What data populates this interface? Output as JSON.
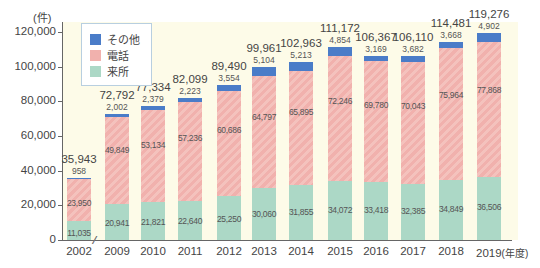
{
  "chart_data": {
    "type": "bar",
    "stacked": true,
    "title": "",
    "xlabel": "(年度)",
    "ylabel": "(件)",
    "ylim": [
      0,
      120000
    ],
    "yticks": [
      0,
      20000,
      40000,
      60000,
      80000,
      100000,
      120000
    ],
    "ytick_labels": [
      "0",
      "20,000",
      "40,000",
      "60,000",
      "80,000",
      "100,000",
      "120,000"
    ],
    "categories": [
      "2002",
      "2009",
      "2010",
      "2011",
      "2012",
      "2013",
      "2014",
      "2015",
      "2016",
      "2017",
      "2018",
      "2019"
    ],
    "axis_break_after": "2002",
    "legend_position": "upper-left",
    "grid": false,
    "series": [
      {
        "name": "来所",
        "color": "#acd8c6",
        "values": [
          11035,
          20941,
          21821,
          22640,
          25250,
          30060,
          31855,
          34072,
          33418,
          32385,
          34849,
          36506
        ]
      },
      {
        "name": "電話",
        "color": "#f1b1ad",
        "values": [
          23950,
          49849,
          53134,
          57236,
          60686,
          64797,
          65895,
          72246,
          69780,
          70043,
          75964,
          77868
        ]
      },
      {
        "name": "その他",
        "color": "#4a7cc8",
        "values": [
          958,
          2002,
          2379,
          2223,
          3554,
          5104,
          5213,
          4854,
          3169,
          3682,
          3668,
          4902
        ]
      }
    ],
    "totals": [
      35943,
      72792,
      77334,
      82099,
      89490,
      99961,
      102963,
      111172,
      106367,
      106110,
      114481,
      119276
    ],
    "value_labels": {
      "visit": [
        "11,035",
        "20,941",
        "21,821",
        "22,640",
        "25,250",
        "30,060",
        "31,855",
        "34,072",
        "33,418",
        "32,385",
        "34,849",
        "36,506"
      ],
      "phone": [
        "23,950",
        "49,849",
        "53,134",
        "57,236",
        "60,686",
        "64,797",
        "65,895",
        "72,246",
        "69,780",
        "70,043",
        "75,964",
        "77,868"
      ],
      "other": [
        "958",
        "2,002",
        "2,379",
        "2,223",
        "3,554",
        "5,104",
        "5,213",
        "4,854",
        "3,169",
        "3,682",
        "3,668",
        "4,902"
      ],
      "total": [
        "35,943",
        "72,792",
        "77,334",
        "82,099",
        "89,490",
        "99,961",
        "102,963",
        "111,172",
        "106,367",
        "106,110",
        "114,481",
        "119,276"
      ]
    }
  },
  "legend": {
    "items": [
      {
        "label": "その他",
        "color": "#4a7cc8"
      },
      {
        "label": "電話",
        "color": "#f1b1ad"
      },
      {
        "label": "来所",
        "color": "#acd8c6"
      }
    ]
  },
  "axis": {
    "y_unit": "(件)",
    "x_unit": "(年度)",
    "break_mark": "≈"
  }
}
